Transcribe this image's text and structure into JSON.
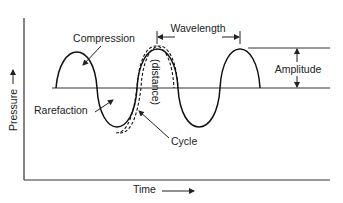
{
  "diagram": {
    "labels": {
      "compression": "Compression",
      "rarefaction": "Rarefaction",
      "wavelength": "Wavelength",
      "amplitude": "Amplitude",
      "distance": "(distance)",
      "cycle": "Cycle",
      "y_axis": "Pressure",
      "x_axis": "Time"
    },
    "colors": {
      "stroke": "#222222",
      "background": "#ffffff"
    }
  }
}
